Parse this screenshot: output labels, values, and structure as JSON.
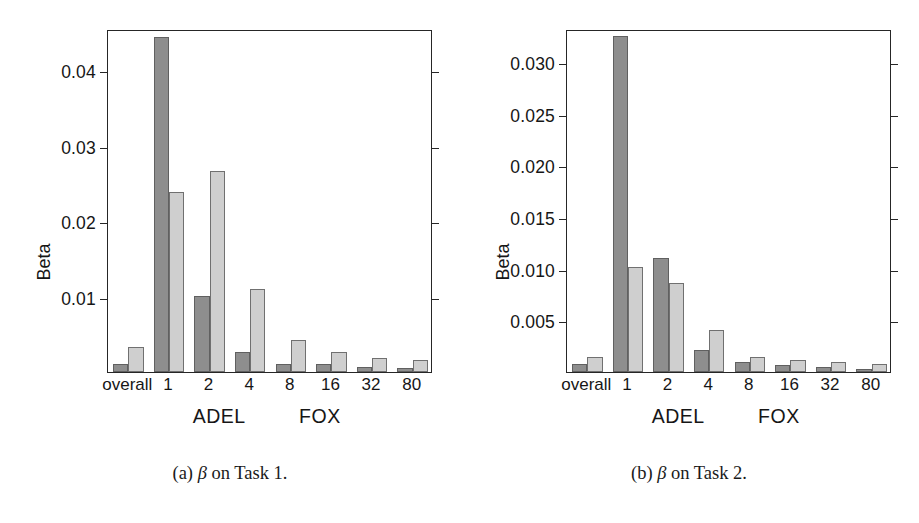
{
  "figure": {
    "axis_title": "Beta",
    "group_labels": [
      "ADEL",
      "FOX"
    ],
    "categories": [
      "overall",
      "1",
      "2",
      "4",
      "8",
      "16",
      "32",
      "80"
    ],
    "series_names": [
      "ADEL",
      "FOX"
    ],
    "colors": {
      "adel_bar": "#8e8e8e",
      "fox_bar": "#cfcfcf",
      "axis": "#262626",
      "background": "#ffffff"
    }
  },
  "panels": [
    {
      "id": "panel-a",
      "caption_prefix": "(a)",
      "caption_symbol": "β",
      "caption_text": "on Task 1.",
      "caption_full": "(a) β on Task 1."
    },
    {
      "id": "panel-b",
      "caption_prefix": "(b)",
      "caption_symbol": "β",
      "caption_text": "on Task 2.",
      "caption_full": "(b) β on Task 2."
    }
  ],
  "chart_data": [
    {
      "type": "bar",
      "title": "(a) β on Task 1.",
      "xlabel": "",
      "ylabel": "Beta",
      "categories": [
        "overall",
        "1",
        "2",
        "4",
        "8",
        "16",
        "32",
        "80"
      ],
      "group_labels": [
        "ADEL",
        "FOX"
      ],
      "series": [
        {
          "name": "ADEL",
          "color": "#8e8e8e",
          "values": [
            0.001,
            0.0445,
            0.0101,
            0.0027,
            0.0011,
            0.001,
            0.0007,
            0.0005
          ]
        },
        {
          "name": "FOX",
          "color": "#cfcfcf",
          "values": [
            0.0033,
            0.0239,
            0.0267,
            0.011,
            0.0042,
            0.0027,
            0.0019,
            0.0016
          ]
        }
      ],
      "yticks": [
        0.01,
        0.02,
        0.03,
        0.04
      ],
      "ytick_labels": [
        "0.01",
        "0.02",
        "0.03",
        "0.04"
      ],
      "ylim": [
        0,
        0.0455
      ],
      "grid": false,
      "legend": "none"
    },
    {
      "type": "bar",
      "title": "(b) β on Task 2.",
      "xlabel": "",
      "ylabel": "Beta",
      "categories": [
        "overall",
        "1",
        "2",
        "4",
        "8",
        "16",
        "32",
        "80"
      ],
      "group_labels": [
        "ADEL",
        "FOX"
      ],
      "series": [
        {
          "name": "ADEL",
          "color": "#8e8e8e",
          "values": [
            0.0008,
            0.0325,
            0.011,
            0.0021,
            0.001,
            0.0007,
            0.0005,
            0.0003
          ]
        },
        {
          "name": "FOX",
          "color": "#cfcfcf",
          "values": [
            0.0015,
            0.0102,
            0.0086,
            0.0041,
            0.0015,
            0.0012,
            0.001,
            0.0008
          ]
        }
      ],
      "yticks": [
        0.005,
        0.01,
        0.015,
        0.02,
        0.025,
        0.03
      ],
      "ytick_labels": [
        "0.005",
        "0.010",
        "0.015",
        "0.020",
        "0.025",
        "0.030"
      ],
      "ylim": [
        0,
        0.0332
      ],
      "grid": false,
      "legend": "none"
    }
  ]
}
